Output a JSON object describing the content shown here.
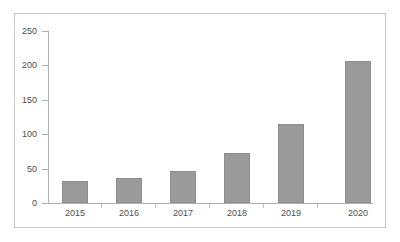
{
  "chart_data": {
    "type": "bar",
    "title": "",
    "subtitle": "",
    "xlabel": "",
    "ylabel": "",
    "categories": [
      "2015",
      "2016",
      "2017",
      "2018",
      "2019",
      "2020"
    ],
    "values": [
      32,
      37,
      47,
      73,
      115,
      207
    ],
    "series": [
      {
        "name": "",
        "values": [
          32,
          37,
          47,
          73,
          115,
          207
        ]
      }
    ],
    "ylim": [
      0,
      250
    ],
    "yticks": [
      0,
      50,
      100,
      150,
      200,
      250
    ],
    "ytick_labels": [
      "0",
      "50",
      "100",
      "150",
      "200",
      "250"
    ],
    "grid": false,
    "legend": false,
    "legend_position": "none",
    "annotations": []
  },
  "style": {
    "bar_color": "#9a9a9a",
    "bar_border_color": "#8e8e8e",
    "axis_color": "#b0b0b0",
    "frame_color": "#c9c9c9",
    "text_color": "#4d4d4d",
    "background": "#ffffff"
  }
}
